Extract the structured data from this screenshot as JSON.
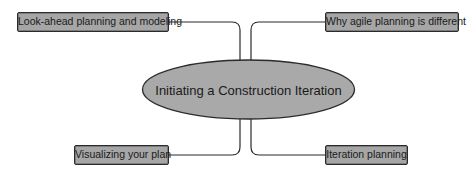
{
  "diagram": {
    "type": "mind-map",
    "center": {
      "label": "Initiating a Construction Iteration"
    },
    "branches": [
      {
        "id": "top-left",
        "label": "Look-ahead planning and modeling"
      },
      {
        "id": "top-right",
        "label": "Why agile planning is different"
      },
      {
        "id": "bottom-left",
        "label": "Visualizing your plan"
      },
      {
        "id": "bottom-right",
        "label": "Iteration planning"
      }
    ],
    "colors": {
      "node_fill": "#a6a6a6",
      "ellipse_fill": "#a9a9a9",
      "stroke": "#2b2b2b",
      "background": "#ffffff"
    }
  }
}
